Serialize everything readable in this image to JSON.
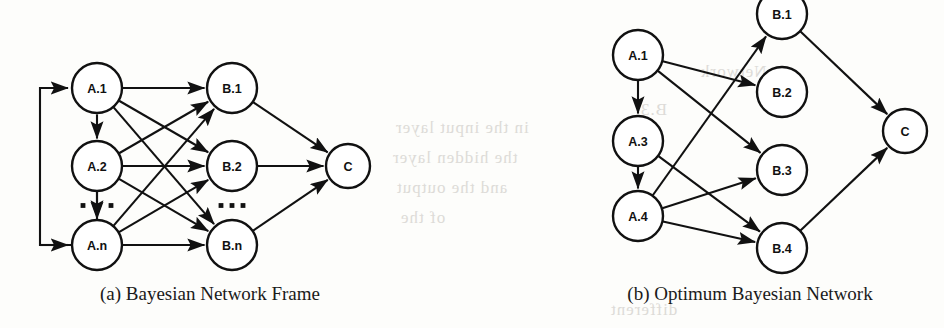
{
  "figure": {
    "kind": "scanned-paper-figure",
    "background_color": "#fdfdfb",
    "ink_color": "#111111",
    "bleed_color": "#d8d6d2"
  },
  "panels": [
    {
      "id": "panel-a",
      "caption": "(a) Bayesian Network Frame",
      "nodes": [
        {
          "id": "A1",
          "label": "A.1",
          "cx": 97,
          "cy": 88,
          "r": 25
        },
        {
          "id": "A2",
          "label": "A.2",
          "cx": 97,
          "cy": 166,
          "r": 25
        },
        {
          "id": "An",
          "label": "A.n",
          "cx": 97,
          "cy": 245,
          "r": 25
        },
        {
          "id": "B1",
          "label": "B.1",
          "cx": 232,
          "cy": 88,
          "r": 25
        },
        {
          "id": "B2",
          "label": "B.2",
          "cx": 232,
          "cy": 166,
          "r": 25
        },
        {
          "id": "Bn",
          "label": "B.n",
          "cx": 232,
          "cy": 245,
          "r": 25
        },
        {
          "id": "C",
          "label": "C",
          "cx": 348,
          "cy": 166,
          "r": 22
        }
      ],
      "edges": [
        {
          "from": "A1",
          "to": "B1"
        },
        {
          "from": "A1",
          "to": "B2"
        },
        {
          "from": "A1",
          "to": "Bn"
        },
        {
          "from": "A2",
          "to": "B1"
        },
        {
          "from": "A2",
          "to": "B2"
        },
        {
          "from": "A2",
          "to": "Bn"
        },
        {
          "from": "An",
          "to": "B1"
        },
        {
          "from": "An",
          "to": "B2"
        },
        {
          "from": "An",
          "to": "Bn"
        },
        {
          "from": "A1",
          "to": "A2",
          "bidirectional": true
        },
        {
          "from": "A2",
          "to": "An",
          "bidirectional": true
        },
        {
          "from": "B1",
          "to": "C"
        },
        {
          "from": "B2",
          "to": "C"
        },
        {
          "from": "Bn",
          "to": "C"
        }
      ],
      "feedback_loop": {
        "from": "An",
        "to": "A1",
        "style": "left-bracket"
      },
      "ellipses": [
        {
          "id": "a-col-ellipsis",
          "orientation": "vertical-with-side-dots",
          "between": [
            "A2",
            "An"
          ]
        },
        {
          "id": "b-col-ellipsis",
          "orientation": "horizontal",
          "between": [
            "B2",
            "Bn"
          ]
        }
      ]
    },
    {
      "id": "panel-b",
      "caption": "(b) Optimum Bayesian Network",
      "nodes": [
        {
          "id": "A1",
          "label": "A.1",
          "cx": 638,
          "cy": 55,
          "r": 25
        },
        {
          "id": "A3",
          "label": "A.3",
          "cx": 638,
          "cy": 141,
          "r": 25
        },
        {
          "id": "A4",
          "label": "A.4",
          "cx": 638,
          "cy": 216,
          "r": 25
        },
        {
          "id": "B1",
          "label": "B.1",
          "cx": 782,
          "cy": 14,
          "r": 25
        },
        {
          "id": "B2",
          "label": "B.2",
          "cx": 782,
          "cy": 92,
          "r": 25
        },
        {
          "id": "B3",
          "label": "B.3",
          "cx": 782,
          "cy": 170,
          "r": 25
        },
        {
          "id": "B4",
          "label": "B.4",
          "cx": 782,
          "cy": 248,
          "r": 25
        },
        {
          "id": "C",
          "label": "C",
          "cx": 905,
          "cy": 131,
          "r": 22
        }
      ],
      "edges": [
        {
          "from": "A1",
          "to": "A3"
        },
        {
          "from": "A3",
          "to": "A4"
        },
        {
          "from": "A1",
          "to": "B2"
        },
        {
          "from": "A1",
          "to": "B3"
        },
        {
          "from": "A3",
          "to": "B4"
        },
        {
          "from": "A4",
          "to": "B1"
        },
        {
          "from": "A4",
          "to": "B3"
        },
        {
          "from": "A4",
          "to": "B4"
        },
        {
          "from": "B1",
          "to": "C"
        },
        {
          "from": "B4",
          "to": "C"
        }
      ]
    }
  ],
  "bleed_text": [
    {
      "text": "in the input layer",
      "x": 395,
      "y": 118
    },
    {
      "text": "the hidden layer",
      "x": 392,
      "y": 148
    },
    {
      "text": "and the output",
      "x": 396,
      "y": 178
    },
    {
      "text": "of the",
      "x": 400,
      "y": 208
    },
    {
      "text": "Network",
      "x": 700,
      "y": 62
    },
    {
      "text": "B.3",
      "x": 640,
      "y": 100
    },
    {
      "text": "different",
      "x": 610,
      "y": 300
    }
  ]
}
